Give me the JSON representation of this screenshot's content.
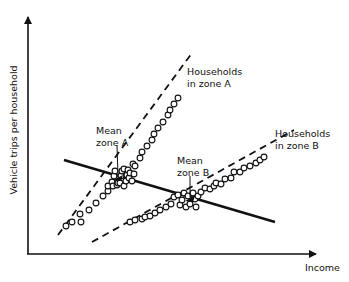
{
  "diagram": {
    "colors": {
      "ink": "#111111",
      "background": "#ffffff"
    },
    "axes": {
      "x_label": "Income",
      "y_label": "Vehicle trips per household"
    },
    "labels": {
      "households_a_line1": "Households",
      "households_a_line2": "in zone A",
      "households_b_line1": "Households",
      "households_b_line2": "in zone B",
      "mean_a_line1": "Mean",
      "mean_a_line2": "zone A",
      "mean_b_line1": "Mean",
      "mean_b_line2": "zone B"
    },
    "series": [
      {
        "name": "Households in zone A",
        "line_style": "dashed",
        "line": [
          [
            58,
            235
          ],
          [
            192,
            53
          ]
        ],
        "mean": [
          118,
          178
        ],
        "points": [
          [
            66,
            226
          ],
          [
            72,
            222
          ],
          [
            80,
            214
          ],
          [
            81,
            222
          ],
          [
            89,
            210
          ],
          [
            96,
            203
          ],
          [
            103,
            196
          ],
          [
            108,
            191
          ],
          [
            108,
            186
          ],
          [
            112,
            182
          ],
          [
            113,
            186
          ],
          [
            114,
            176
          ],
          [
            115,
            171
          ],
          [
            117,
            185
          ],
          [
            118,
            183
          ],
          [
            120,
            183
          ],
          [
            121,
            176
          ],
          [
            122,
            171
          ],
          [
            124,
            169
          ],
          [
            124,
            186
          ],
          [
            126,
            181
          ],
          [
            127,
            175
          ],
          [
            128,
            170
          ],
          [
            129,
            178
          ],
          [
            130,
            173
          ],
          [
            132,
            181
          ],
          [
            133,
            164
          ],
          [
            134,
            174
          ],
          [
            135,
            166
          ],
          [
            140,
            158
          ],
          [
            142,
            152
          ],
          [
            147,
            146
          ],
          [
            152,
            140
          ],
          [
            154,
            134
          ],
          [
            158,
            128
          ],
          [
            163,
            122
          ],
          [
            168,
            115
          ],
          [
            170,
            110
          ],
          [
            174,
            104
          ],
          [
            178,
            98
          ]
        ]
      },
      {
        "name": "Households in zone B",
        "line_style": "dashed",
        "line": [
          [
            92,
            242
          ],
          [
            294,
            130
          ]
        ],
        "mean": [
          190,
          199
        ],
        "points": [
          [
            130,
            222
          ],
          [
            135,
            220
          ],
          [
            142,
            219
          ],
          [
            145,
            217
          ],
          [
            150,
            216
          ],
          [
            155,
            213
          ],
          [
            160,
            210
          ],
          [
            166,
            207
          ],
          [
            171,
            204
          ],
          [
            174,
            197
          ],
          [
            178,
            195
          ],
          [
            180,
            205
          ],
          [
            182,
            200
          ],
          [
            184,
            193
          ],
          [
            186,
            207
          ],
          [
            188,
            196
          ],
          [
            190,
            204
          ],
          [
            193,
            193
          ],
          [
            195,
            199
          ],
          [
            196,
            207
          ],
          [
            198,
            196
          ],
          [
            201,
            192
          ],
          [
            205,
            188
          ],
          [
            210,
            189
          ],
          [
            214,
            186
          ],
          [
            216,
            183
          ],
          [
            221,
            184
          ],
          [
            225,
            179
          ],
          [
            231,
            178
          ],
          [
            234,
            172
          ],
          [
            240,
            172
          ],
          [
            244,
            168
          ],
          [
            250,
            166
          ],
          [
            256,
            163
          ],
          [
            260,
            160
          ],
          [
            264,
            157
          ]
        ]
      }
    ],
    "regression_line": {
      "line_style": "solid",
      "from": [
        64,
        160
      ],
      "to": [
        275,
        222
      ]
    }
  }
}
